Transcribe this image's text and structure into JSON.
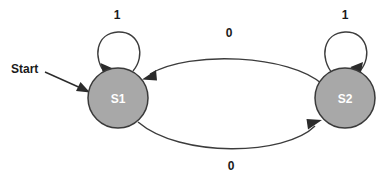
{
  "diagram": {
    "background_color": "#ffffff",
    "stroke_color": "#3c3c3c",
    "state_fill_color": "#a8a8a8",
    "state_stroke_color": "#3a3a3a",
    "state_text_color": "#ffffff",
    "label_text_color": "#1a1a1a",
    "start": {
      "label": "Start"
    },
    "states": [
      {
        "id": "s1",
        "label": "S1",
        "cx": 118,
        "cy": 98,
        "r": 30
      },
      {
        "id": "s2",
        "label": "S2",
        "cx": 345,
        "cy": 98,
        "r": 30
      }
    ],
    "transitions": [
      {
        "id": "s1-self",
        "from": "S1",
        "to": "S1",
        "label": "1",
        "kind": "self-loop"
      },
      {
        "id": "s2-self",
        "from": "S2",
        "to": "S2",
        "label": "1",
        "kind": "self-loop"
      },
      {
        "id": "s2-to-s1",
        "from": "S2",
        "to": "S1",
        "label": "0",
        "kind": "arc-top"
      },
      {
        "id": "s1-to-s2",
        "from": "S1",
        "to": "S2",
        "label": "0",
        "kind": "arc-bottom"
      }
    ]
  }
}
